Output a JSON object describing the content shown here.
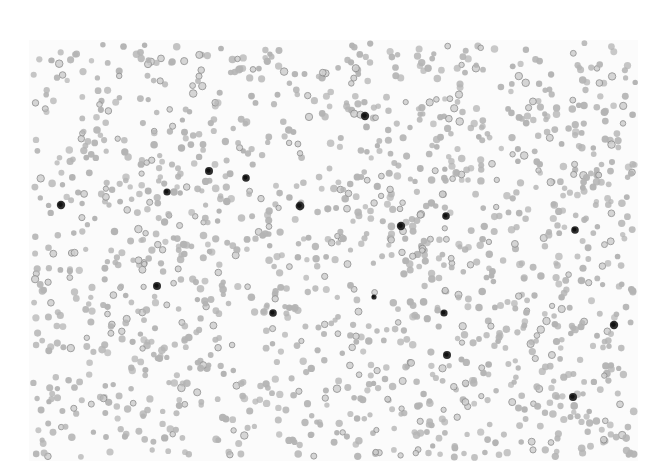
{
  "image": {
    "kind": "blood-smear-micrograph",
    "description": "Grayscale light-microscopy field of a peripheral blood smear showing many red blood cells and scattered dark-staining white blood cells",
    "canvas": {
      "width": 668,
      "height": 474,
      "background": "#ffffff"
    },
    "field": {
      "x": 29,
      "y": 40,
      "width": 609,
      "height": 421,
      "background": "#fbfbfb"
    },
    "colors": {
      "rbc_fill": "#b4b4b4",
      "rbc_ring": "#8e8e8e",
      "rbc_center": "#cfcfcf",
      "wbc_fill": "#2e2e2e",
      "wbc_nucleus": "#111111"
    },
    "rbc": {
      "count": 1500,
      "radius_min": 2.6,
      "radius_max": 3.8,
      "seed": 7331
    },
    "wbc": [
      {
        "x": 61,
        "y": 205,
        "r": 4.2
      },
      {
        "x": 167,
        "y": 192,
        "r": 3.6
      },
      {
        "x": 209,
        "y": 171,
        "r": 4.0
      },
      {
        "x": 246,
        "y": 178,
        "r": 3.8
      },
      {
        "x": 300,
        "y": 206,
        "r": 4.4
      },
      {
        "x": 157,
        "y": 286,
        "r": 4.0
      },
      {
        "x": 273,
        "y": 313,
        "r": 3.8
      },
      {
        "x": 365,
        "y": 116,
        "r": 4.2
      },
      {
        "x": 401,
        "y": 226,
        "r": 4.2
      },
      {
        "x": 446,
        "y": 216,
        "r": 3.8
      },
      {
        "x": 575,
        "y": 230,
        "r": 3.8
      },
      {
        "x": 444,
        "y": 313,
        "r": 3.6
      },
      {
        "x": 447,
        "y": 355,
        "r": 4.0
      },
      {
        "x": 614,
        "y": 325,
        "r": 4.2
      },
      {
        "x": 573,
        "y": 397,
        "r": 4.0
      },
      {
        "x": 374,
        "y": 297,
        "r": 2.6
      }
    ]
  }
}
